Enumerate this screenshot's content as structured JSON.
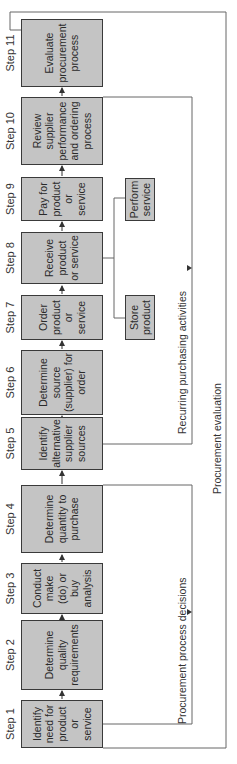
{
  "diagram": {
    "type": "flowchart",
    "orientation": "rotated-90-ccw",
    "steps": [
      {
        "label": "Step 1",
        "text": "Identify need for product or service"
      },
      {
        "label": "Step 2",
        "text": "Determine quality requirements"
      },
      {
        "label": "Step 3",
        "text": "Conduct make (do) or buy analysis"
      },
      {
        "label": "Step 4",
        "text": "Determine quantity to purchase"
      },
      {
        "label": "Step 5",
        "text": "Identify alternative supplier sources"
      },
      {
        "label": "Step 6",
        "text": "Determine source (supplier) for order"
      },
      {
        "label": "Step 7",
        "text": "Order product or service"
      },
      {
        "label": "Step 8",
        "text": "Receive product or service"
      },
      {
        "label": "Step 9",
        "text": "Pay for product or service"
      },
      {
        "label": "Step 10",
        "text": "Review supplier performance and ordering process"
      },
      {
        "label": "Step 11",
        "text": "Evaluate procurement process"
      }
    ],
    "side_boxes": [
      {
        "text": "Store product"
      },
      {
        "text": "Perform service"
      }
    ],
    "feedback_loops": [
      {
        "label": "Procurement process decisions"
      },
      {
        "label": "Recurring purchasing activities"
      },
      {
        "label": "Procurement evaluation"
      }
    ],
    "colors": {
      "box_fill": "#c4c4c4",
      "box_border": "#3a3a3a",
      "line": "#555555",
      "background": "#ffffff"
    }
  }
}
